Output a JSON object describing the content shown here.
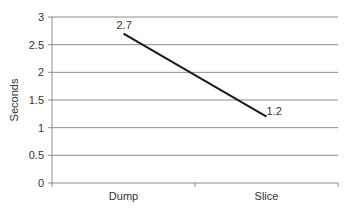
{
  "chart_data": {
    "type": "line",
    "title": "",
    "xlabel": "",
    "ylabel": "Seconds",
    "categories": [
      "Dump",
      "Slice"
    ],
    "series": [
      {
        "name": "Seconds",
        "values": [
          2.7,
          1.2
        ],
        "color": "#1a1a1a"
      }
    ],
    "data_labels": [
      "2.7",
      "1.2"
    ],
    "ylim": [
      0,
      3
    ],
    "yticks": [
      0,
      0.5,
      1,
      1.5,
      2,
      2.5,
      3
    ],
    "ytick_labels": [
      "0",
      "0.5",
      "1",
      "1.5",
      "2",
      "2.5",
      "3"
    ],
    "grid": true,
    "legend": null
  },
  "colors": {
    "gridline": "#8c8c8c",
    "axis": "#8c8c8c",
    "line": "#1a1a1a",
    "text": "#333333"
  }
}
